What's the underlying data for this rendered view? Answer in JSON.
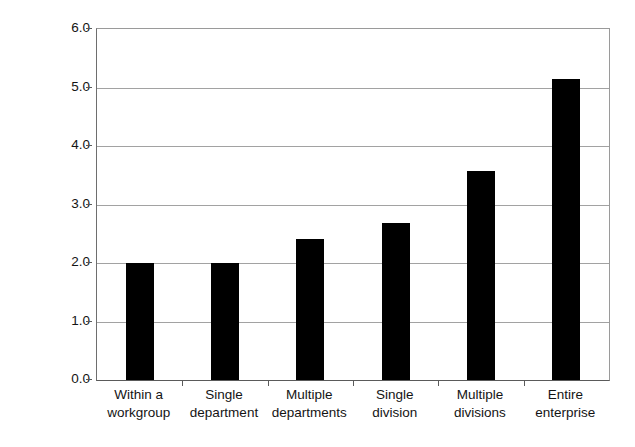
{
  "chart_data": {
    "type": "bar",
    "title": "",
    "xlabel": "",
    "ylabel": "Average FTE dedicated to change management",
    "categories": [
      "Within a workgroup",
      "Single department",
      "Multiple departments",
      "Single division",
      "Multiple divisions",
      "Entire enterprise"
    ],
    "category_lines": [
      [
        "Within a",
        "workgroup"
      ],
      [
        "Single",
        "department"
      ],
      [
        "Multiple",
        "departments"
      ],
      [
        "Single",
        "division"
      ],
      [
        "Multiple",
        "divisions"
      ],
      [
        "Entire",
        "enterprise"
      ]
    ],
    "values": [
      2.0,
      2.0,
      2.41,
      2.68,
      3.57,
      5.15
    ],
    "ylim": [
      0.0,
      6.0
    ],
    "ytick_step": 1.0,
    "yticks": [
      "0.0",
      "1.0",
      "2.0",
      "3.0",
      "4.0",
      "5.0",
      "6.0"
    ],
    "ytick_values": [
      0.0,
      1.0,
      2.0,
      3.0,
      4.0,
      5.0,
      6.0
    ],
    "grid": "horizontal",
    "legend": "none",
    "bar_color": "#000000",
    "grid_color": "#a2a2a2",
    "axis_color": "#5a5a5a",
    "background": "#ffffff"
  }
}
